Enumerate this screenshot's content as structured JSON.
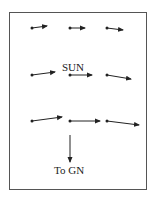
{
  "diagram": {
    "labels": {
      "sun": "SUN",
      "to_gn": "To GN"
    },
    "colors": {
      "line": "#222222",
      "frame": "#555555",
      "background": "#ffffff"
    },
    "vectors": [
      {
        "row": 1,
        "col": 1,
        "x1": 32,
        "y1": 28,
        "x2": 47,
        "y2": 26
      },
      {
        "row": 1,
        "col": 2,
        "x1": 70,
        "y1": 28,
        "x2": 85,
        "y2": 28
      },
      {
        "row": 1,
        "col": 3,
        "x1": 107,
        "y1": 28,
        "x2": 123,
        "y2": 30
      },
      {
        "row": 2,
        "col": 1,
        "x1": 32,
        "y1": 75,
        "x2": 55,
        "y2": 72
      },
      {
        "row": 2,
        "col": 2,
        "x1": 70,
        "y1": 75,
        "x2": 92,
        "y2": 75
      },
      {
        "row": 2,
        "col": 3,
        "x1": 107,
        "y1": 75,
        "x2": 131,
        "y2": 79
      },
      {
        "row": 3,
        "col": 1,
        "x1": 32,
        "y1": 121,
        "x2": 62,
        "y2": 117
      },
      {
        "row": 3,
        "col": 2,
        "x1": 70,
        "y1": 121,
        "x2": 100,
        "y2": 121
      },
      {
        "row": 3,
        "col": 3,
        "x1": 107,
        "y1": 121,
        "x2": 139,
        "y2": 125
      }
    ],
    "direction_arrow": {
      "x1": 70,
      "y1": 135,
      "x2": 70,
      "y2": 162
    }
  }
}
